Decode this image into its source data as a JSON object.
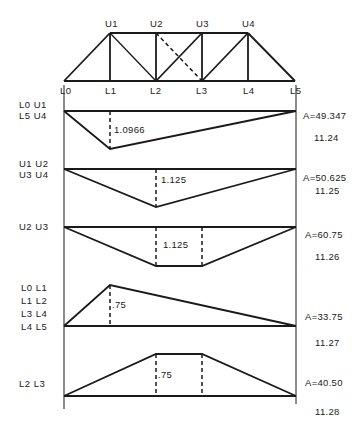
{
  "truss": {
    "top_nodes": [
      "U1",
      "U2",
      "U3",
      "U4"
    ],
    "bottom_nodes": [
      "L0",
      "L1",
      "L2",
      "L3",
      "L4",
      "L5"
    ]
  },
  "influence_lines": [
    {
      "members": [
        "L0 U1",
        "L5 U4"
      ],
      "shape": "triangle-below",
      "ordinate_label": "1.0966",
      "area_label": "A=49.347",
      "figure_label": "11.24"
    },
    {
      "members": [
        "U1 U2",
        "U3 U4"
      ],
      "shape": "triangle-below",
      "ordinate_label": "1.125",
      "area_label": "A=50.625",
      "figure_label": "11.25"
    },
    {
      "members": [
        "U2 U3"
      ],
      "shape": "trapezoid-below",
      "ordinate_label": "1.125",
      "area_label": "A=60.75",
      "figure_label": "11.26"
    },
    {
      "members": [
        "L0 L1",
        "L1 L2",
        "L3 L4",
        "L4 L5"
      ],
      "shape": "triangle-above",
      "ordinate_label": ".75",
      "area_label": "A=33.75",
      "figure_label": "11.27"
    },
    {
      "members": [
        "L2 L3"
      ],
      "shape": "trapezoid-above",
      "ordinate_label": ".75",
      "area_label": "A=40.50",
      "figure_label": "11.28"
    }
  ]
}
